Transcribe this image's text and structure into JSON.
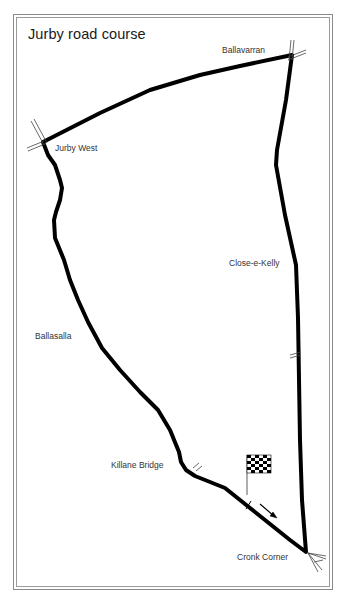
{
  "title": "Jurby road course",
  "locations": [
    {
      "name": "Ballavarran",
      "x": 222,
      "y": 45
    },
    {
      "name": "Jurby West",
      "x": 55,
      "y": 143
    },
    {
      "name": "Close-e-Kelly",
      "x": 229,
      "y": 258
    },
    {
      "name": "Ballasalla",
      "x": 35,
      "y": 331
    },
    {
      "name": "Killane Bridge",
      "x": 111,
      "y": 460
    },
    {
      "name": "Cronk Corner",
      "x": 237,
      "y": 552
    }
  ],
  "colors": {
    "track": "#000000",
    "border": "#8a8a8a",
    "text": "#333333"
  },
  "icons": {
    "start_finish": "checkered-flag-icon",
    "direction": "arrow-icon"
  }
}
